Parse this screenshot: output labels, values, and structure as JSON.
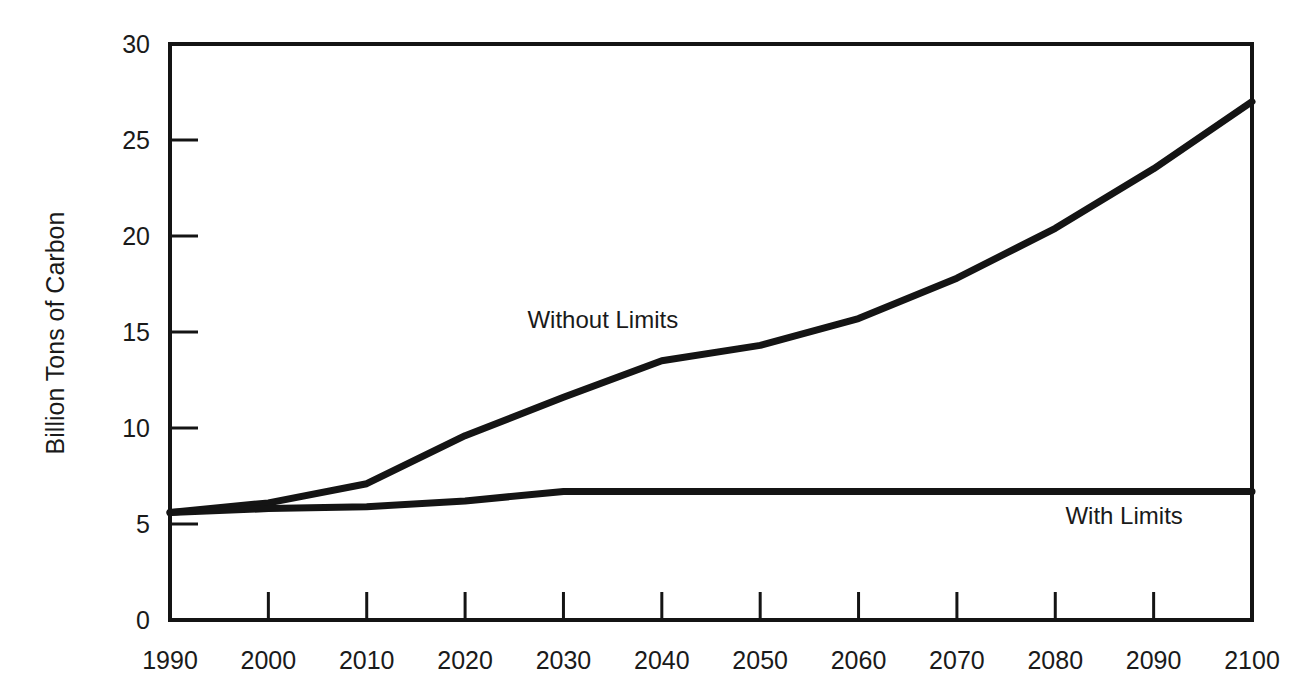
{
  "chart_data": {
    "type": "line",
    "title": "",
    "xlabel": "",
    "ylabel": "Billion Tons of Carbon",
    "x": [
      1990,
      2000,
      2010,
      2020,
      2030,
      2040,
      2050,
      2060,
      2070,
      2080,
      2090,
      2100
    ],
    "x_tick_labels": [
      "1990",
      "2000",
      "2010",
      "2020",
      "2030",
      "2040",
      "2050",
      "2060",
      "2070",
      "2080",
      "2090",
      "2100"
    ],
    "y_ticks": [
      0,
      5,
      10,
      15,
      20,
      25,
      30
    ],
    "y_tick_labels": [
      "0",
      "5",
      "10",
      "15",
      "20",
      "25",
      "30"
    ],
    "ylim": [
      0,
      30
    ],
    "xlim": [
      1990,
      2100
    ],
    "grid": false,
    "legend": "none (inline annotations)",
    "series": [
      {
        "name": "Without Limits",
        "values": [
          5.6,
          6.1,
          7.1,
          9.6,
          11.6,
          13.5,
          14.3,
          15.7,
          17.8,
          20.4,
          23.5,
          27.0
        ]
      },
      {
        "name": "With Limits",
        "values": [
          5.6,
          5.8,
          5.9,
          6.2,
          6.7,
          6.7,
          6.7,
          6.7,
          6.7,
          6.7,
          6.7,
          6.7
        ]
      }
    ],
    "annotations": [
      {
        "text": "Without Limits",
        "x": 2034,
        "y": 15.2
      },
      {
        "text": "With Limits",
        "x": 2087,
        "y": 5.0
      }
    ]
  },
  "style": {
    "line_color": "#141414",
    "axis_color": "#141414",
    "background": "#ffffff"
  }
}
